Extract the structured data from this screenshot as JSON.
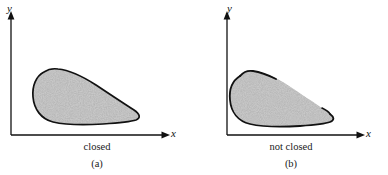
{
  "figure": {
    "background_color": "#ffffff",
    "ink_color": "#111111",
    "fill_color": "#bdbdbd",
    "panels": [
      {
        "id": "a",
        "caption": "closed",
        "index_label": "(a)",
        "axes": {
          "x_label": "x",
          "y_label": "y",
          "x_axis_arrow": true,
          "y_axis_arrow": true
        },
        "region": {
          "name": "closed-region",
          "boundary": "complete",
          "fill": "stippled-gray",
          "description": "teardrop shaped blob, rounded at left, tapering to a point at right, entire outline drawn"
        }
      },
      {
        "id": "b",
        "caption": "not closed",
        "index_label": "(b)",
        "axes": {
          "x_label": "x",
          "y_label": "y",
          "x_axis_arrow": true,
          "y_axis_arrow": true
        },
        "region": {
          "name": "not-closed-region",
          "boundary": "broken",
          "fill": "stippled-gray",
          "description": "teardrop shaped blob with missing boundary segments along the top and the upper right edge"
        }
      }
    ]
  }
}
